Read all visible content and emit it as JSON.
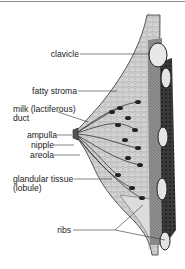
{
  "diagram": {
    "labels": [
      {
        "id": "clavicle",
        "text": "clavicle"
      },
      {
        "id": "fatty-stroma",
        "text": "fatty stroma"
      },
      {
        "id": "milk-duct",
        "line1": "milk (lactiferous)",
        "line2": "duct"
      },
      {
        "id": "ampulla",
        "text": "ampulla"
      },
      {
        "id": "nipple",
        "text": "nipple"
      },
      {
        "id": "areola",
        "text": "areola"
      },
      {
        "id": "glandular-tissue",
        "line1": "glandular tissue",
        "line2": "(lobule)"
      },
      {
        "id": "ribs",
        "text": "ribs"
      }
    ],
    "colors": {
      "background": "#ffffff",
      "ink": "#222222",
      "tissue_light": "#c9c9c9",
      "tissue_mid": "#8f8f8f",
      "muscle_dark": "#3a3a3a",
      "rib_fill": "#e4e4e4"
    }
  }
}
